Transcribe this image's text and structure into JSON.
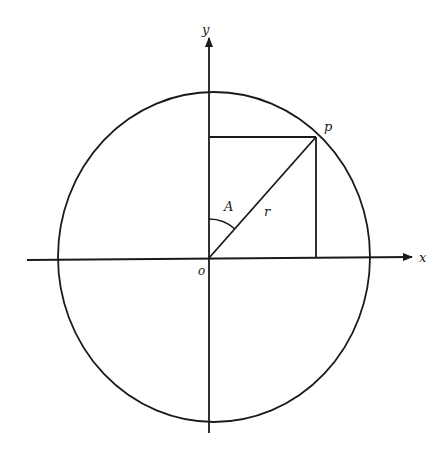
{
  "diagram": {
    "type": "unit-circle-polar-coordinates",
    "labels": {
      "y_axis": "y",
      "x_axis": "x",
      "origin": "o",
      "point": "p",
      "angle": "A",
      "radius": "r"
    },
    "colors": {
      "stroke": "#1a1a1a",
      "background": "#ffffff"
    },
    "geometry": {
      "origin": [
        209,
        258
      ],
      "circle_center": [
        214,
        257
      ],
      "circle_rx": 156,
      "circle_ry": 165,
      "point_p": [
        316,
        137
      ],
      "x_axis": {
        "from": [
          27,
          260
        ],
        "to": [
          412,
          257
        ]
      },
      "y_axis": {
        "from": [
          209,
          433
        ],
        "to": [
          209,
          38
        ]
      }
    },
    "caption_clipped": true
  }
}
